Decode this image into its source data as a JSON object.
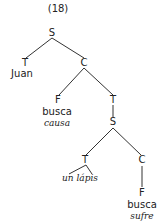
{
  "example_number": "(18)",
  "nodes": {
    "root_s": "S",
    "t1": "T",
    "juan": "Juan",
    "c1": "C",
    "f1": "F",
    "busca1": "busca",
    "causa": "causa",
    "t2": "T",
    "s2": "S",
    "t3": "T",
    "un_lapis": "un lápis",
    "c2": "C",
    "f2": "F",
    "busca2": "busca",
    "sufre": "sufre"
  },
  "colors": {
    "text": "#222222",
    "line": "#333333",
    "background": "#ffffff"
  }
}
